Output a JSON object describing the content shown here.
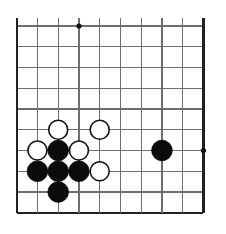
{
  "figure": {
    "board_label": "go-board",
    "background_color": "#ffffff",
    "line_color": "#6e6e6e",
    "edge_color": "#202020",
    "black_color": "#0b0b0b",
    "white_color": "#ffffff"
  },
  "board": {
    "columns": 10,
    "rows": 10,
    "origin_x": 16.7,
    "origin_y": 26.0,
    "cell_size": 20.75,
    "stone_radius": 10.3,
    "star_radius": 2.6,
    "edges": {
      "left": true,
      "top": false,
      "right": true,
      "bottom": true
    },
    "star_points": [
      {
        "col": 4,
        "row": 1
      },
      {
        "col": 10,
        "row": 7
      }
    ],
    "stones": [
      {
        "color": "white",
        "col": 3,
        "row": 6
      },
      {
        "color": "white",
        "col": 5,
        "row": 6
      },
      {
        "color": "white",
        "col": 2,
        "row": 7
      },
      {
        "color": "black",
        "col": 3,
        "row": 7
      },
      {
        "color": "white",
        "col": 4,
        "row": 7
      },
      {
        "color": "black",
        "col": 8,
        "row": 7
      },
      {
        "color": "black",
        "col": 2,
        "row": 8
      },
      {
        "color": "black",
        "col": 3,
        "row": 8
      },
      {
        "color": "black",
        "col": 4,
        "row": 8
      },
      {
        "color": "white",
        "col": 5,
        "row": 8
      },
      {
        "color": "black",
        "col": 3,
        "row": 9
      }
    ]
  }
}
